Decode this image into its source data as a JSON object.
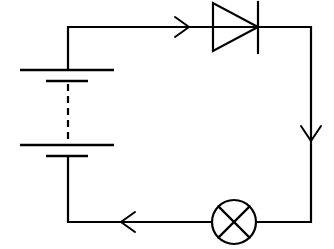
{
  "diagram": {
    "type": "circuit",
    "colors": {
      "stroke": "#000000",
      "background": "#ffffff"
    },
    "components": [
      {
        "id": "battery",
        "kind": "battery",
        "cells_shown": 2,
        "gap": "dashed (more cells implied)"
      },
      {
        "id": "diode",
        "kind": "diode",
        "orientation": "forward, pointing right"
      },
      {
        "id": "lamp",
        "kind": "lamp",
        "symbol": "circle with X"
      }
    ],
    "current_arrows": [
      {
        "location": "top wire",
        "direction": "right"
      },
      {
        "location": "right wire",
        "direction": "down"
      },
      {
        "location": "bottom wire",
        "direction": "left"
      }
    ],
    "connections": [
      "battery+ -> diode",
      "diode -> lamp",
      "lamp -> battery-"
    ]
  }
}
